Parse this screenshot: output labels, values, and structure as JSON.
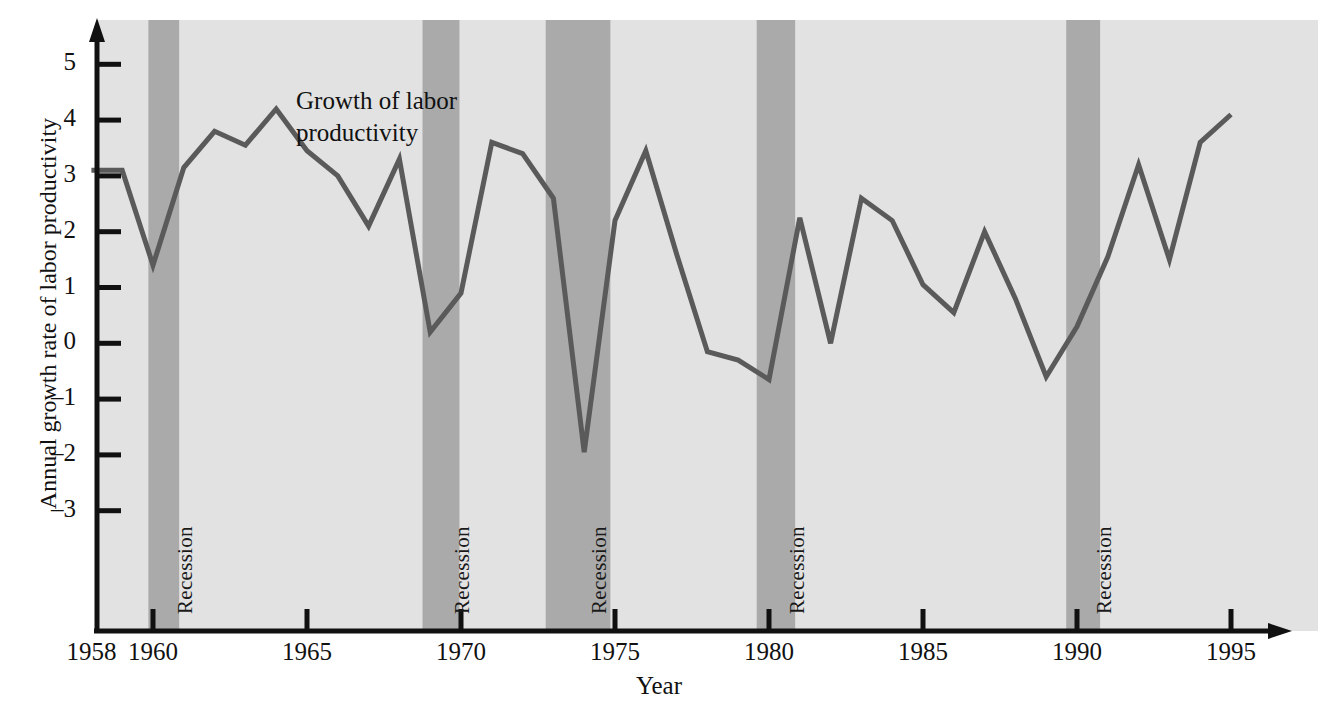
{
  "figure": {
    "background_color": "#ffffff",
    "plot_background_color": "#e2e2e2",
    "recession_band_color": "#aaaaaa",
    "line_color": "#5a5a5a",
    "axis_color": "#111111"
  },
  "annotation": {
    "line1": "Growth of labor",
    "line2": "productivity"
  },
  "recession_label": "Recession",
  "chart_data": {
    "type": "line",
    "title": "",
    "xlabel": "Year",
    "ylabel": "Annual growth rate of labor productivity",
    "xlim": [
      1958,
      1995.6
    ],
    "ylim": [
      -3.6,
      5.5
    ],
    "grid": false,
    "legend": null,
    "x_ticks": [
      1958,
      1960,
      1965,
      1970,
      1975,
      1980,
      1985,
      1990,
      1995
    ],
    "x_tick_labels": [
      "1958",
      "1960",
      "1965",
      "1970",
      "1975",
      "1980",
      "1985",
      "1990",
      "1995"
    ],
    "y_ticks": [
      5,
      4,
      3,
      2,
      1,
      0,
      -1,
      -2,
      -3
    ],
    "y_tick_labels": [
      "5",
      "4",
      "3",
      "2",
      "1",
      "0",
      "–1",
      "–2",
      "–3"
    ],
    "series": [
      {
        "name": "Growth of labor productivity",
        "color": "#5a5a5a",
        "x": [
          1958,
          1959,
          1960,
          1961,
          1962,
          1963,
          1964,
          1965,
          1966,
          1967,
          1968,
          1969,
          1970,
          1971,
          1972,
          1973,
          1974,
          1975,
          1976,
          1977,
          1978,
          1979,
          1980,
          1981,
          1982,
          1983,
          1984,
          1985,
          1986,
          1987,
          1988,
          1989,
          1990,
          1991,
          1992,
          1993,
          1994,
          1995
        ],
        "values": [
          3.1,
          3.1,
          1.4,
          3.15,
          3.8,
          3.55,
          4.2,
          3.45,
          3.0,
          2.1,
          3.3,
          0.2,
          0.9,
          3.6,
          3.4,
          2.6,
          -1.95,
          2.2,
          3.45,
          1.6,
          -0.15,
          -0.3,
          -0.65,
          2.25,
          0.0,
          2.6,
          2.2,
          1.05,
          0.55,
          2.0,
          0.8,
          -0.6,
          0.3,
          1.55,
          3.2,
          1.5,
          3.6,
          4.1
        ]
      }
    ],
    "recessions": [
      {
        "label": "Recession",
        "start": 1959.85,
        "end": 1960.85
      },
      {
        "label": "Recession",
        "start": 1968.75,
        "end": 1969.95
      },
      {
        "label": "Recession",
        "start": 1972.75,
        "end": 1974.85
      },
      {
        "label": "Recession",
        "start": 1979.6,
        "end": 1980.85
      },
      {
        "label": "Recession",
        "start": 1989.65,
        "end": 1990.75
      }
    ]
  }
}
